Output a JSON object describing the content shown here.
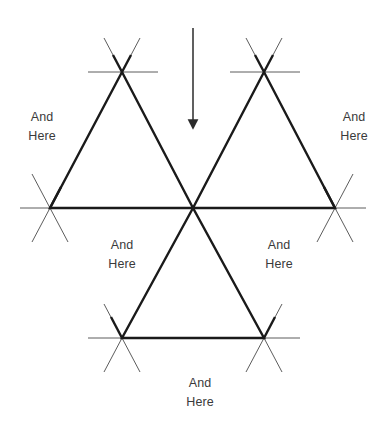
{
  "canvas": {
    "width": 386,
    "height": 425,
    "background": "#ffffff"
  },
  "colors": {
    "edge_thick": "#1a1a1a",
    "edge_thin": "#4a4a4a",
    "arrow": "#2b2b2b",
    "text": "#3a3a3a"
  },
  "figure": {
    "title_clipped": "",
    "vertices": {
      "top_left": {
        "x": 122,
        "y": 72
      },
      "top_right": {
        "x": 264,
        "y": 72
      },
      "mid_left": {
        "x": 50,
        "y": 208
      },
      "center": {
        "x": 193,
        "y": 208
      },
      "mid_right": {
        "x": 335,
        "y": 208
      },
      "bottom_left": {
        "x": 122,
        "y": 338
      },
      "bottom_right": {
        "x": 264,
        "y": 338
      }
    },
    "triangles": [
      {
        "name": "upper-left-triangle",
        "points": "122,72 50,208 193,208"
      },
      {
        "name": "upper-right-triangle",
        "points": "264,72 193,208 335,208"
      },
      {
        "name": "lower-center-triangle",
        "points": "193,208 122,338 264,338"
      }
    ],
    "arrow": {
      "name": "down-arrow",
      "x": 193,
      "y_start": 28,
      "y_end": 132,
      "direction": "down"
    }
  },
  "labels": [
    {
      "id": "label-upper-left",
      "line1": "And",
      "line2": "Here",
      "x": 18,
      "y": 108
    },
    {
      "id": "label-upper-right",
      "line1": "And",
      "line2": "Here",
      "x": 330,
      "y": 108
    },
    {
      "id": "label-inner-left",
      "line1": "And",
      "line2": "Here",
      "x": 98,
      "y": 236
    },
    {
      "id": "label-inner-right",
      "line1": "And",
      "line2": "Here",
      "x": 255,
      "y": 236
    },
    {
      "id": "label-bottom",
      "line1": "And",
      "line2": "Here",
      "x": 176,
      "y": 374
    }
  ]
}
